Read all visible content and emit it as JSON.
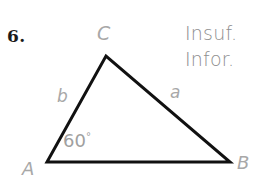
{
  "page": {
    "background_color": "#ffffff",
    "width": 258,
    "height": 193
  },
  "problem": {
    "number_label": "6."
  },
  "figure": {
    "type": "triangle",
    "stroke_color": "#111111",
    "stroke_width": 3,
    "label_color": "#a8a8a8",
    "vertices": [
      {
        "name": "A",
        "label": "A",
        "x": 47,
        "y": 162
      },
      {
        "name": "B",
        "label": "B",
        "x": 230,
        "y": 162
      },
      {
        "name": "C",
        "label": "C",
        "x": 106,
        "y": 56
      }
    ],
    "sides": [
      {
        "name": "a",
        "label": "a",
        "between": "C-B"
      },
      {
        "name": "b",
        "label": "b",
        "between": "A-C"
      }
    ],
    "angles": [
      {
        "at_vertex": "A",
        "value": "60",
        "degree_symbol": "°",
        "label": "60°"
      }
    ]
  },
  "annotation": {
    "line_1": "Insuf.",
    "line_2": "Infor.",
    "color": "#8e8e8e"
  }
}
